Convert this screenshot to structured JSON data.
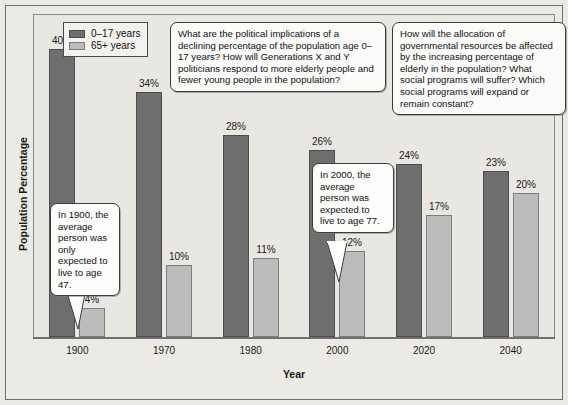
{
  "chart_data": {
    "type": "bar",
    "title": "",
    "xlabel": "Year",
    "ylabel": "Population Percentage",
    "categories": [
      "1900",
      "1970",
      "1980",
      "2000",
      "2020",
      "2040"
    ],
    "ylim": [
      0,
      42
    ],
    "grid": false,
    "legend_position": "top-left",
    "series": [
      {
        "name": "0–17 years",
        "color": "#6e6e6e",
        "values": [
          40,
          34,
          28,
          26,
          24,
          23
        ],
        "labels": [
          "40%",
          "34%",
          "28%",
          "26%",
          "24%",
          "23%"
        ]
      },
      {
        "name": "65+ years",
        "color": "#bcbcbc",
        "values": [
          4,
          10,
          11,
          12,
          17,
          20
        ],
        "labels": [
          "4%",
          "10%",
          "11%",
          "12%",
          "17%",
          "20%"
        ]
      }
    ],
    "annotations": [
      {
        "id": "note-left",
        "text": "What are the political implications of a declining percentage of the population age 0–17 years? How will Generations X and Y politicians respond to more elderly people and fewer young people in the population?"
      },
      {
        "id": "note-right",
        "text": "How will the allocation of governmental resources be affected by the increasing percentage of elderly in the population? What social programs will suffer? Which social programs will expand or remain constant?"
      },
      {
        "id": "bubble-1900",
        "text": "In 1900, the average person was only expected to live to age 47.",
        "points_at": "1900 / 65+ years"
      },
      {
        "id": "bubble-2000",
        "text": "In 2000, the average person was expected to live to age 77.",
        "points_at": "2000 / 65+ years"
      }
    ]
  },
  "legend": {
    "items": [
      {
        "label": "0–17 years",
        "swatch": "dark-gray-swatch"
      },
      {
        "label": "65+ years",
        "swatch": "light-gray-swatch"
      }
    ]
  },
  "axes": {
    "y_title": "Population Percentage",
    "x_title": "Year"
  }
}
